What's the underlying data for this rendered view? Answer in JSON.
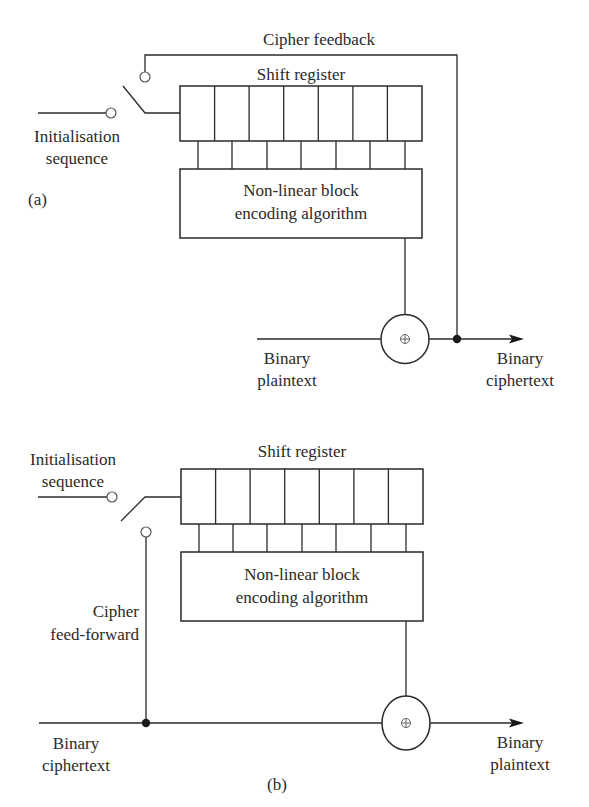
{
  "figure": {
    "panel_a": {
      "tag": "(a)",
      "feedback_label": "Cipher feedback",
      "register_label": "Shift register",
      "register_cells": 7,
      "encoder_line1": "Non-linear block",
      "encoder_line2": "encoding algorithm",
      "init_line1": "Initialisation",
      "init_line2": "sequence",
      "input_line1": "Binary",
      "input_line2": "plaintext",
      "output_line1": "Binary",
      "output_line2": "ciphertext",
      "xor_symbol": "⊕"
    },
    "panel_b": {
      "tag": "(b)",
      "feedforward_line1": "Cipher",
      "feedforward_line2": "feed-forward",
      "register_label": "Shift register",
      "register_cells": 7,
      "encoder_line1": "Non-linear block",
      "encoder_line2": "encoding algorithm",
      "init_line1": "Initialisation",
      "init_line2": "sequence",
      "input_line1": "Binary",
      "input_line2": "ciphertext",
      "output_line1": "Binary",
      "output_line2": "plaintext",
      "xor_symbol": "⊕"
    }
  }
}
